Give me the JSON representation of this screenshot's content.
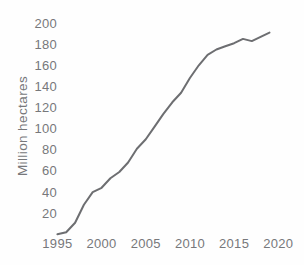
{
  "figure": {
    "background": "#fefefe",
    "text_color": "#77787b",
    "line_color": "#6d6e71"
  },
  "chart_data": {
    "type": "line",
    "title": "",
    "xlabel": "",
    "ylabel": "Million hectares",
    "x": [
      1995,
      1996,
      1997,
      1998,
      1999,
      2000,
      2001,
      2002,
      2003,
      2004,
      2005,
      2006,
      2007,
      2008,
      2009,
      2010,
      2011,
      2012,
      2013,
      2014,
      2015,
      2016,
      2017,
      2018,
      2019
    ],
    "values": [
      0,
      2,
      11,
      28,
      40,
      44,
      53,
      59,
      68,
      81,
      90,
      102,
      114,
      125,
      134,
      148,
      160,
      170,
      175,
      178,
      181,
      185,
      183,
      187,
      191
    ],
    "x_ticks": [
      1995,
      2000,
      2005,
      2010,
      2015,
      2020
    ],
    "y_ticks": [
      20,
      40,
      60,
      80,
      100,
      120,
      140,
      160,
      180,
      200
    ],
    "xlim": [
      1995,
      2020
    ],
    "ylim": [
      0,
      200
    ],
    "grid": false,
    "axes_lines": false,
    "legend_position": "none",
    "line_width": 2
  }
}
